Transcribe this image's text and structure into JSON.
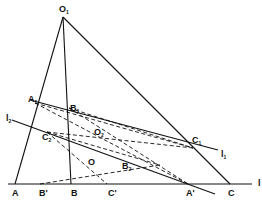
{
  "diagram": {
    "type": "geometry",
    "colors": {
      "line": "#111111",
      "background": "#ffffff"
    },
    "points": {
      "O1": [
        63,
        17
      ],
      "A": [
        15,
        184
      ],
      "B": [
        71,
        184
      ],
      "C": [
        230,
        184
      ],
      "Bp": [
        40,
        184
      ],
      "Cp": [
        107,
        184
      ],
      "Ap": [
        188,
        184
      ],
      "A1": [
        35,
        103
      ],
      "B1": [
        69,
        108
      ],
      "C1": [
        193,
        148
      ],
      "C2": [
        47,
        132
      ],
      "B2": [
        180,
        159
      ],
      "O2": [
        93,
        130
      ],
      "O": [
        90,
        161
      ]
    },
    "labels": [
      {
        "id": "O1",
        "text": "O",
        "sub": "1",
        "x": 59,
        "y": 12
      },
      {
        "id": "A1",
        "text": "A",
        "sub": "1",
        "x": 28,
        "y": 102
      },
      {
        "id": "B1",
        "text": "B",
        "sub": "1",
        "x": 70,
        "y": 111
      },
      {
        "id": "l2",
        "text": "l",
        "sub": "2",
        "x": 6,
        "y": 121
      },
      {
        "id": "C2",
        "text": "C",
        "sub": "2",
        "x": 42,
        "y": 140
      },
      {
        "id": "O2",
        "text": "O",
        "sub": "2",
        "x": 94,
        "y": 135
      },
      {
        "id": "C1",
        "text": "C",
        "sub": "1",
        "x": 192,
        "y": 143
      },
      {
        "id": "l1",
        "text": "l",
        "sub": "1",
        "x": 221,
        "y": 157
      },
      {
        "id": "O",
        "text": "O",
        "sub": "",
        "x": 88,
        "y": 165
      },
      {
        "id": "B2",
        "text": "B",
        "sub": "2",
        "x": 122,
        "y": 169
      },
      {
        "id": "A",
        "text": "A",
        "sub": "",
        "x": 12,
        "y": 196
      },
      {
        "id": "Bp",
        "text": "B'",
        "sub": "",
        "x": 39,
        "y": 196
      },
      {
        "id": "B",
        "text": "B",
        "sub": "",
        "x": 71,
        "y": 196
      },
      {
        "id": "Cp",
        "text": "C'",
        "sub": "",
        "x": 108,
        "y": 196
      },
      {
        "id": "Ap",
        "text": "A'",
        "sub": "",
        "x": 186,
        "y": 196
      },
      {
        "id": "C",
        "text": "C",
        "sub": "",
        "x": 228,
        "y": 196
      },
      {
        "id": "l",
        "text": "l",
        "sub": "",
        "x": 258,
        "y": 186
      }
    ],
    "solid_lines": [
      [
        63,
        17,
        15,
        184
      ],
      [
        63,
        17,
        71,
        184
      ],
      [
        63,
        17,
        230,
        184
      ],
      [
        8,
        184,
        252,
        184
      ],
      [
        30,
        100,
        218,
        150
      ],
      [
        12,
        120,
        215,
        194
      ]
    ],
    "dashed_lines": [
      [
        35,
        103,
        193,
        148
      ],
      [
        69,
        108,
        193,
        148
      ],
      [
        47,
        132,
        193,
        148
      ],
      [
        69,
        108,
        188,
        184
      ],
      [
        35,
        103,
        188,
        184
      ],
      [
        47,
        132,
        107,
        184
      ],
      [
        40,
        184,
        160,
        165
      ],
      [
        47,
        132,
        160,
        165
      ]
    ]
  }
}
